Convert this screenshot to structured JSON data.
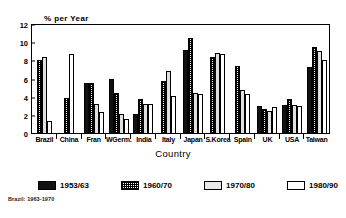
{
  "chart_data": {
    "type": "bar",
    "title": "",
    "subtitle": "",
    "ylabel": "% per Year",
    "xlabel": "Country",
    "ylim": [
      0,
      12
    ],
    "yticks": [
      0,
      2,
      4,
      6,
      8,
      10,
      12
    ],
    "ytick_labels": [
      "0",
      "2",
      "4",
      "6",
      "8",
      "10",
      "12"
    ],
    "grid": false,
    "legend_position": "bottom",
    "categories": [
      "Brazil",
      "China",
      "Fran",
      "WGerm.",
      "India",
      "Italy",
      "Japan",
      "S.Korea",
      "Spain",
      "UK",
      "USA",
      "Taiwan"
    ],
    "series": [
      {
        "name": "1953/63",
        "key": "s0",
        "color": "#111111",
        "values": [
          null,
          null,
          5.6,
          6.1,
          2.2,
          null,
          9.2,
          null,
          null,
          3.1,
          3.2,
          7.4
        ]
      },
      {
        "name": "1960/70",
        "key": "s1",
        "color": "#ffffff",
        "pattern": "cross-hatch",
        "values": [
          8.1,
          4.0,
          5.6,
          4.5,
          3.9,
          5.8,
          10.6,
          8.5,
          7.5,
          2.8,
          3.9,
          9.6
        ]
      },
      {
        "name": "1970/80",
        "key": "s2",
        "color": "#e0e0e0",
        "values": [
          8.5,
          null,
          3.3,
          2.2,
          3.3,
          6.9,
          4.5,
          8.9,
          4.9,
          2.5,
          3.2,
          9.1
        ]
      },
      {
        "name": "1980/90",
        "key": "s3",
        "color": "#ffffff",
        "values": [
          1.4,
          8.8,
          2.4,
          1.6,
          3.3,
          4.2,
          4.4,
          8.8,
          4.4,
          3.0,
          3.1,
          8.2
        ]
      }
    ],
    "footnote": "Brazil: 1963-1970"
  }
}
